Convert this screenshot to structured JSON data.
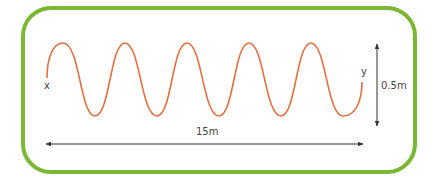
{
  "diagram": {
    "title": "",
    "labels": {
      "start_point": "x",
      "end_point": "y",
      "length": "15m",
      "amplitude": "0.5m"
    },
    "wave": {
      "type": "sine",
      "cycles": 5,
      "color": "#e07040"
    },
    "frame_color": "#7ab733",
    "arrow_color": "#333333"
  }
}
